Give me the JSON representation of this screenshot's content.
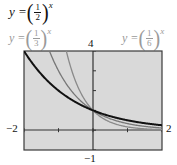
{
  "labels": {
    "main_eq": {
      "lhs": "y = ",
      "num": "1",
      "den": "2",
      "exp": "x"
    },
    "third_eq": {
      "lhs": "y = ",
      "num": "1",
      "den": "3",
      "exp": "x"
    },
    "sixth_eq": {
      "lhs": "y = ",
      "num": "1",
      "den": "6",
      "exp": "x"
    },
    "ymax": "4",
    "ymin": "−1",
    "xmin": "−2",
    "xmax": "2"
  },
  "colors": {
    "background": "#d9d9d9",
    "frame": "#3a3a3a",
    "axis": "#333333",
    "half": "#111111",
    "third": "#777777",
    "sixth": "#8a8a8a"
  },
  "chart_data": {
    "type": "line",
    "xlabel": "",
    "ylabel": "",
    "xlim": [
      -2,
      2
    ],
    "ylim": [
      -1,
      4
    ],
    "grid": false,
    "x_ticks": [
      -2,
      -1,
      0,
      1,
      2
    ],
    "y_ticks": [
      -1,
      0,
      1,
      2,
      3,
      4
    ],
    "tick_labels": {
      "xmin": "-2",
      "xmax": "2",
      "ymin": "-1",
      "ymax": "4"
    },
    "series": [
      {
        "name": "y = (1/2)^x",
        "base": 0.5,
        "x": [
          -2,
          -1,
          0,
          1,
          2
        ],
        "values": [
          4,
          2,
          1,
          0.5,
          0.25
        ],
        "style": "black, thick"
      },
      {
        "name": "y = (1/3)^x",
        "base": 0.3333,
        "x": [
          -1.26,
          -1,
          0,
          1,
          2
        ],
        "values": [
          4,
          3,
          1,
          0.333,
          0.111
        ],
        "style": "gray"
      },
      {
        "name": "y = (1/6)^x",
        "base": 0.1667,
        "x": [
          -0.77,
          -0.5,
          0,
          1,
          2
        ],
        "values": [
          4,
          2.449,
          1,
          0.167,
          0.028
        ],
        "style": "gray"
      }
    ],
    "legend": "labels placed above plot"
  }
}
